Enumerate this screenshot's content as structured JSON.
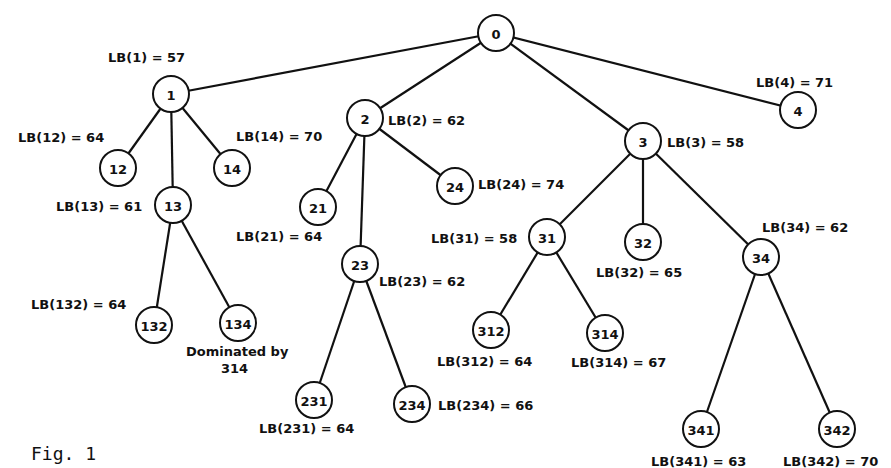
{
  "figure": {
    "caption": "Fig. 1",
    "annotation_line1": "Dominated by",
    "annotation_line2": "314"
  },
  "nodes": [
    {
      "id": "0",
      "label": "0",
      "x": 496,
      "y": 33
    },
    {
      "id": "1",
      "label": "1",
      "x": 171,
      "y": 94
    },
    {
      "id": "2",
      "label": "2",
      "x": 365,
      "y": 118
    },
    {
      "id": "3",
      "label": "3",
      "x": 643,
      "y": 141
    },
    {
      "id": "4",
      "label": "4",
      "x": 798,
      "y": 110
    },
    {
      "id": "12",
      "label": "12",
      "x": 118,
      "y": 168
    },
    {
      "id": "13",
      "label": "13",
      "x": 173,
      "y": 205
    },
    {
      "id": "14",
      "label": "14",
      "x": 232,
      "y": 168
    },
    {
      "id": "21",
      "label": "21",
      "x": 318,
      "y": 207
    },
    {
      "id": "23",
      "label": "23",
      "x": 360,
      "y": 264
    },
    {
      "id": "24",
      "label": "24",
      "x": 455,
      "y": 186
    },
    {
      "id": "31",
      "label": "31",
      "x": 547,
      "y": 237
    },
    {
      "id": "32",
      "label": "32",
      "x": 643,
      "y": 242
    },
    {
      "id": "34",
      "label": "34",
      "x": 761,
      "y": 257
    },
    {
      "id": "132",
      "label": "132",
      "x": 154,
      "y": 325
    },
    {
      "id": "134",
      "label": "134",
      "x": 238,
      "y": 323
    },
    {
      "id": "231",
      "label": "231",
      "x": 314,
      "y": 400
    },
    {
      "id": "234",
      "label": "234",
      "x": 412,
      "y": 404
    },
    {
      "id": "312",
      "label": "312",
      "x": 491,
      "y": 330
    },
    {
      "id": "314",
      "label": "314",
      "x": 605,
      "y": 333
    },
    {
      "id": "341",
      "label": "341",
      "x": 701,
      "y": 429
    },
    {
      "id": "342",
      "label": "342",
      "x": 837,
      "y": 429
    }
  ],
  "edges": [
    [
      "0",
      "1"
    ],
    [
      "0",
      "2"
    ],
    [
      "0",
      "3"
    ],
    [
      "0",
      "4"
    ],
    [
      "1",
      "12"
    ],
    [
      "1",
      "13"
    ],
    [
      "1",
      "14"
    ],
    [
      "2",
      "21"
    ],
    [
      "2",
      "23"
    ],
    [
      "2",
      "24"
    ],
    [
      "3",
      "31"
    ],
    [
      "3",
      "32"
    ],
    [
      "3",
      "34"
    ],
    [
      "13",
      "132"
    ],
    [
      "13",
      "134"
    ],
    [
      "23",
      "231"
    ],
    [
      "23",
      "234"
    ],
    [
      "31",
      "312"
    ],
    [
      "31",
      "314"
    ],
    [
      "34",
      "341"
    ],
    [
      "34",
      "342"
    ]
  ],
  "lower_bounds": [
    {
      "node": "1",
      "text": "LB(1) = 57",
      "value": 57,
      "x": 108,
      "y": 62
    },
    {
      "node": "2",
      "text": "LB(2) = 62",
      "value": 62,
      "x": 388,
      "y": 125
    },
    {
      "node": "3",
      "text": "LB(3) = 58",
      "value": 58,
      "x": 667,
      "y": 147
    },
    {
      "node": "4",
      "text": "LB(4) = 71",
      "value": 71,
      "x": 756,
      "y": 87
    },
    {
      "node": "12",
      "text": "LB(12) = 64",
      "value": 64,
      "x": 18,
      "y": 142
    },
    {
      "node": "13",
      "text": "LB(13) = 61",
      "value": 61,
      "x": 56,
      "y": 211
    },
    {
      "node": "14",
      "text": "LB(14) = 70",
      "value": 70,
      "x": 236,
      "y": 141
    },
    {
      "node": "21",
      "text": "LB(21) = 64",
      "value": 64,
      "x": 236,
      "y": 241
    },
    {
      "node": "23",
      "text": "LB(23) = 62",
      "value": 62,
      "x": 379,
      "y": 286
    },
    {
      "node": "24",
      "text": "LB(24) = 74",
      "value": 74,
      "x": 478,
      "y": 189
    },
    {
      "node": "31",
      "text": "LB(31) = 58",
      "value": 58,
      "x": 431,
      "y": 243
    },
    {
      "node": "32",
      "text": "LB(32) = 65",
      "value": 65,
      "x": 596,
      "y": 277
    },
    {
      "node": "34",
      "text": "LB(34) = 62",
      "value": 62,
      "x": 762,
      "y": 232
    },
    {
      "node": "132",
      "text": "LB(132) = 64",
      "value": 64,
      "x": 31,
      "y": 309
    },
    {
      "node": "231",
      "text": "LB(231) = 64",
      "value": 64,
      "x": 259,
      "y": 433
    },
    {
      "node": "234",
      "text": "LB(234) = 66",
      "value": 66,
      "x": 438,
      "y": 410
    },
    {
      "node": "312",
      "text": "LB(312) = 64",
      "value": 64,
      "x": 437,
      "y": 366
    },
    {
      "node": "314",
      "text": "LB(314) = 67",
      "value": 67,
      "x": 571,
      "y": 367
    },
    {
      "node": "341",
      "text": "LB(341) = 63",
      "value": 63,
      "x": 651,
      "y": 466
    },
    {
      "node": "342",
      "text": "LB(342) = 70",
      "value": 70,
      "x": 783,
      "y": 466
    }
  ]
}
